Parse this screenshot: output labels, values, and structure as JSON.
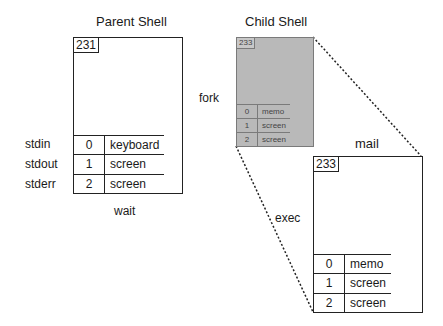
{
  "titles": {
    "parent": "Parent Shell",
    "child": "Child Shell",
    "mail": "mail"
  },
  "actions": {
    "fork": "fork",
    "wait": "wait",
    "exec": "exec"
  },
  "stream_labels": [
    "stdin",
    "stdout",
    "stderr"
  ],
  "parent": {
    "pid": "231",
    "fds": [
      {
        "fd": "0",
        "target": "keyboard"
      },
      {
        "fd": "1",
        "target": "screen"
      },
      {
        "fd": "2",
        "target": "screen"
      }
    ]
  },
  "child": {
    "pid": "233",
    "fds": [
      {
        "fd": "0",
        "target": "memo"
      },
      {
        "fd": "1",
        "target": "screen"
      },
      {
        "fd": "2",
        "target": "screen"
      }
    ]
  },
  "mail": {
    "pid": "233",
    "fds": [
      {
        "fd": "0",
        "target": "memo"
      },
      {
        "fd": "1",
        "target": "screen"
      },
      {
        "fd": "2",
        "target": "screen"
      }
    ]
  },
  "colors": {
    "child_fill": "#b9b9b9",
    "line": "#222222"
  }
}
